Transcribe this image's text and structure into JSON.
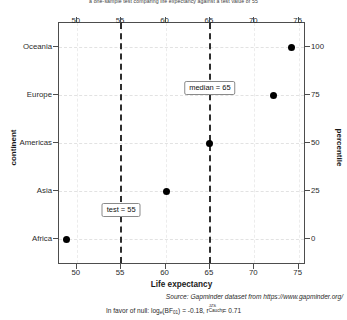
{
  "chart_data": {
    "type": "scatter",
    "title": "a one-sample test comparing life expectancy against a test value of 55",
    "xlabel": "Life expectancy",
    "ylabel": "continent",
    "y2label": "percentile",
    "categories": [
      "Africa",
      "Asia",
      "Americas",
      "Europe",
      "Oceania"
    ],
    "values": [
      48.9,
      60.1,
      65.0,
      72.2,
      74.2
    ],
    "percentiles": [
      0,
      25,
      50,
      75,
      100
    ],
    "xlim": [
      48.0,
      75.6
    ],
    "xticks": [
      50,
      55,
      60,
      65,
      70,
      75
    ],
    "y2ticks": [
      0,
      25,
      50,
      75,
      100
    ],
    "grid": true,
    "legend": "none",
    "reference_lines": [
      {
        "name": "test",
        "value": 55,
        "label": "test = 55"
      },
      {
        "name": "median",
        "value": 65,
        "label": "median = 65"
      }
    ],
    "annotations": [
      {
        "label": "test = 55",
        "x": 55,
        "y_pct": 22
      },
      {
        "label": "median = 65",
        "x": 65,
        "y_pct": 73
      }
    ],
    "source_note": "Source: Gapminder dataset from https://www.gapminder.org/",
    "stat_note": {
      "prefix": "In favor of null: log",
      "log_base": "e",
      "bf": "(BF",
      "bf_sub": "01",
      "bf_close": ") = ",
      "bf_value": "-0.18",
      "sep": ", ",
      "r_symbol": "r",
      "r_sup": "JZS",
      "r_sub": "Cauchy",
      "r_eq": " = ",
      "r_value": "0.71"
    }
  },
  "colors": {
    "point": "#000000",
    "refline": "#2e2e2e",
    "panel_border": "#4d4d4d",
    "grid": "#e2e2e2",
    "background": "#ffffff",
    "text": "#1a1a1a"
  }
}
